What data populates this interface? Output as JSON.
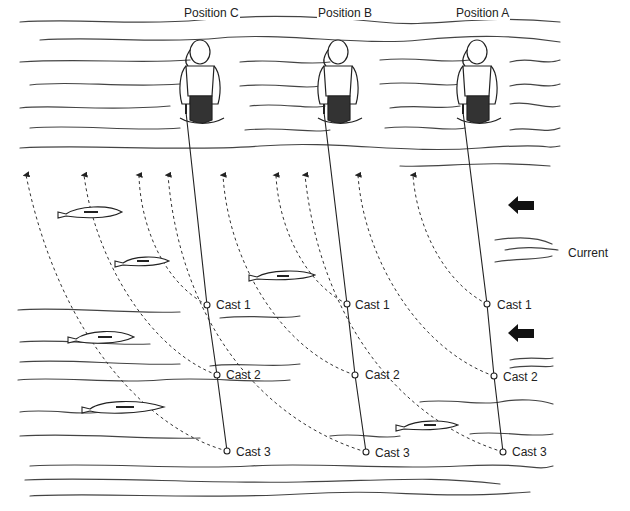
{
  "diagram": {
    "type": "fly-fishing casting sequence",
    "positions": [
      {
        "label": "Position C",
        "x": 183,
        "y": 6,
        "angler_x": 200
      },
      {
        "label": "Position B",
        "x": 317,
        "y": 6,
        "angler_x": 340
      },
      {
        "label": "Position A",
        "x": 455,
        "y": 6,
        "angler_x": 480
      }
    ],
    "casts": [
      {
        "position": "C",
        "label": "Cast 1",
        "x": 207,
        "y": 305
      },
      {
        "position": "C",
        "label": "Cast 2",
        "x": 217,
        "y": 375
      },
      {
        "position": "C",
        "label": "Cast 3",
        "x": 227,
        "y": 451
      },
      {
        "position": "B",
        "label": "Cast 1",
        "x": 347,
        "y": 304
      },
      {
        "position": "B",
        "label": "Cast 2",
        "x": 355,
        "y": 375
      },
      {
        "position": "B",
        "label": "Cast 3",
        "x": 366,
        "y": 452
      },
      {
        "position": "A",
        "label": "Cast 1",
        "x": 487,
        "y": 304
      },
      {
        "position": "A",
        "label": "Cast 2",
        "x": 494,
        "y": 376
      },
      {
        "position": "A",
        "label": "Cast 3",
        "x": 503,
        "y": 452
      }
    ],
    "current": {
      "label": "Current",
      "direction": "left",
      "color": "#111111"
    },
    "fish_count": 6,
    "drift_arrow_count": 9
  }
}
